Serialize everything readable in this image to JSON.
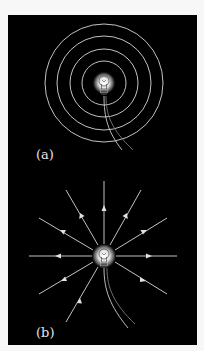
{
  "figure": {
    "background": "#000000",
    "line_color": "#d8d8d8",
    "panels": [
      {
        "id": "a",
        "label": "(a)",
        "description": "Light bulb with concentric circular field lines",
        "bulb_center": [
          104,
          83
        ],
        "circle_radii": [
          22,
          34,
          47,
          59
        ]
      },
      {
        "id": "b",
        "label": "(b)",
        "description": "Light bulb with radial field lines pointing outward",
        "bulb_center": [
          104,
          256
        ],
        "ray_endpoints": [
          [
            104,
            181
          ],
          [
            141,
            190
          ],
          [
            167,
            218
          ],
          [
            177,
            256
          ],
          [
            167,
            294
          ],
          [
            39,
            294
          ],
          [
            29,
            256
          ],
          [
            39,
            218
          ],
          [
            66,
            190
          ],
          [
            66,
            322
          ]
        ]
      }
    ]
  }
}
